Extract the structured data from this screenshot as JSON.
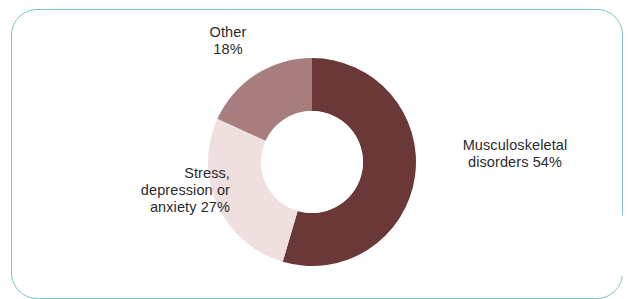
{
  "figure": {
    "background_color": "#ffffff",
    "frame_color": "#7cc6c4"
  },
  "labels": {
    "other": {
      "line1": "Other",
      "line2": "18%"
    },
    "musculoskeletal": {
      "line1": "Musculoskeletal",
      "line2": "disorders 54%"
    },
    "stress": {
      "line1": "Stress,",
      "line2": "depression or",
      "line3": "anxiety 27%"
    }
  },
  "chart_data": {
    "type": "pie",
    "variant": "donut",
    "title": "",
    "subtitle": "",
    "xlabel": "",
    "ylabel": "",
    "grid": false,
    "legend_position": "none",
    "labels_placement": "outside-callout",
    "start_angle_deg": 0,
    "direction": "clockwise",
    "inner_radius_ratio": 0.49,
    "units": "percent",
    "total": 99,
    "categories": [
      "Musculoskeletal disorders",
      "Stress, depression or anxiety",
      "Other"
    ],
    "values": [
      54,
      27,
      18
    ],
    "colors": [
      "#6b3838",
      "#f0dfdf",
      "#a87d7d"
    ],
    "slices": [
      {
        "name": "Musculoskeletal disorders",
        "value": 54,
        "label": "Musculoskeletal disorders 54%",
        "color": "#6b3838"
      },
      {
        "name": "Stress, depression or anxiety",
        "value": 27,
        "label": "Stress, depression or anxiety 27%",
        "color": "#f0dfdf"
      },
      {
        "name": "Other",
        "value": 18,
        "label": "Other 18%",
        "color": "#a87d7d"
      }
    ]
  }
}
